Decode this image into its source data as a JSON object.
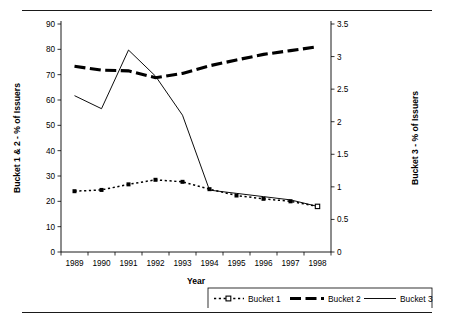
{
  "chart_data": {
    "type": "line",
    "title": "",
    "xlabel": "Year",
    "categories": [
      "1989",
      "1990",
      "1991",
      "1992",
      "1993",
      "1994",
      "1995",
      "1996",
      "1997",
      "1998"
    ],
    "left_axis": {
      "label": "Bucket 1 & 2 - % of Issuers",
      "ylim": [
        0,
        90
      ],
      "ticks": [
        0,
        10,
        20,
        30,
        40,
        50,
        60,
        70,
        80,
        90
      ],
      "tick_labels": [
        "0",
        "10",
        "20",
        "30",
        "40",
        "50",
        "60",
        "70",
        "80",
        "90"
      ]
    },
    "right_axis": {
      "label": "Bucket 3 - % of Issuers",
      "ylim": [
        0,
        3.5
      ],
      "ticks": [
        0,
        0.5,
        1,
        1.5,
        2,
        2.5,
        3,
        3.5
      ],
      "tick_labels": [
        "0",
        "0.5",
        "1",
        "1.5",
        "2",
        "2.5",
        "3",
        "3.5"
      ]
    },
    "grid": false,
    "legend_position": "bottom-right",
    "series": [
      {
        "name": "Bucket 1",
        "axis": "left",
        "style": "dotted-with-square-markers",
        "values": [
          24.0,
          24.5,
          26.7,
          28.5,
          27.7,
          24.8,
          22.3,
          21.0,
          20.0,
          18.0
        ]
      },
      {
        "name": "Bucket 2",
        "axis": "left",
        "style": "thick-dashed",
        "values": [
          73.3,
          71.8,
          71.5,
          68.8,
          70.5,
          73.5,
          75.8,
          78.0,
          79.5,
          81.0
        ]
      },
      {
        "name": "Bucket 3",
        "axis": "right",
        "style": "thin-solid",
        "values": [
          2.4,
          2.2,
          3.1,
          2.7,
          2.1,
          0.95,
          0.9,
          0.85,
          0.8,
          0.7
        ]
      }
    ]
  },
  "legend": {
    "items": [
      {
        "label": "Bucket 1"
      },
      {
        "label": "Bucket 2"
      },
      {
        "label": "Bucket 3"
      }
    ]
  },
  "colors": {
    "ink": "#000000",
    "background": "#ffffff"
  }
}
